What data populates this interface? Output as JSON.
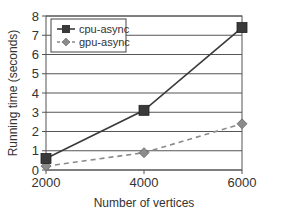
{
  "chart_data": {
    "type": "line",
    "title": "",
    "xlabel": "Number of vertices",
    "ylabel": "Running time (seconds)",
    "x": [
      2000,
      4000,
      6000
    ],
    "x_tick_labels": [
      "2000",
      "4000",
      "6000"
    ],
    "y_tick_labels": [
      "0",
      "1",
      "2",
      "3",
      "4",
      "5",
      "6",
      "7",
      "8"
    ],
    "xlim": [
      2000,
      6000
    ],
    "ylim": [
      0,
      8
    ],
    "grid": "horizontal",
    "legend_position": "upper left",
    "series": [
      {
        "name": "cpu-async",
        "values": [
          0.6,
          3.1,
          7.4
        ],
        "marker": "square",
        "line_style": "solid",
        "color": "#3a3a3a"
      },
      {
        "name": "gpu-async",
        "values": [
          0.2,
          0.9,
          2.4
        ],
        "marker": "diamond",
        "line_style": "dashed",
        "color": "#8a8a8a"
      }
    ]
  },
  "colors": {
    "axis": "#555555",
    "grid": "#555555",
    "text": "#333333",
    "background": "#ffffff"
  }
}
